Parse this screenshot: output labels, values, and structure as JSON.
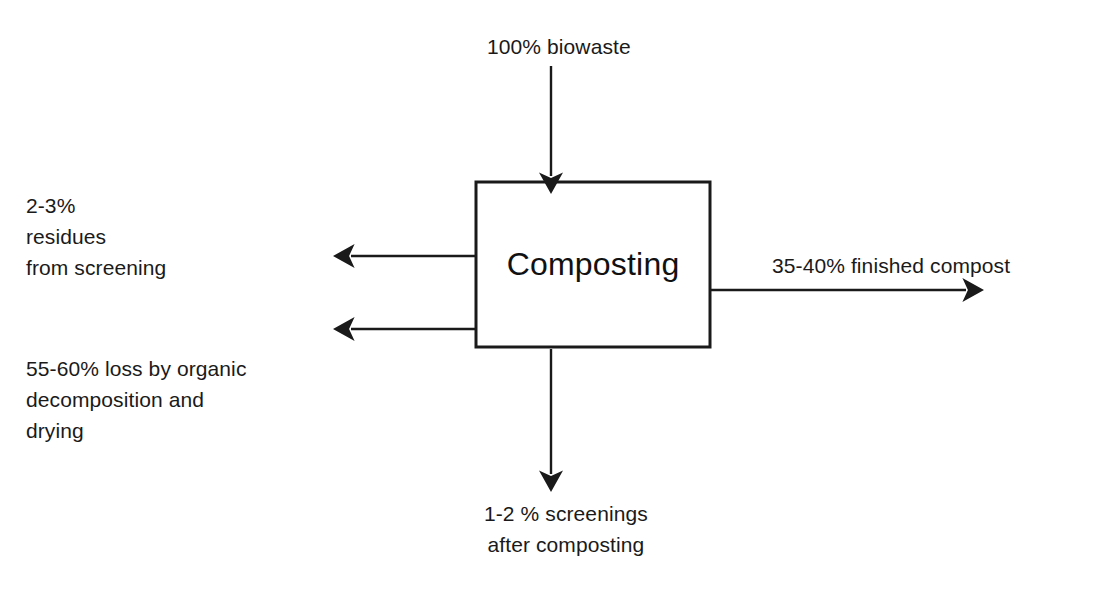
{
  "diagram": {
    "type": "process-flow",
    "stroke_color": "#1a1a1a",
    "text_color": "#1a1a1a",
    "background_color": "#ffffff",
    "process": {
      "name": "Composting",
      "label": "Composting"
    },
    "flows": [
      {
        "id": "input-top",
        "label": "100% biowaste",
        "direction": "down",
        "role": "input",
        "percent_min": 100,
        "percent_max": 100
      },
      {
        "id": "residues-screening",
        "label": "2-3%\nresidues\nfrom screening",
        "direction": "left",
        "role": "output",
        "percent_min": 2,
        "percent_max": 3
      },
      {
        "id": "organic-loss",
        "label": "55-60% loss by organic\ndecomposition and\ndrying",
        "direction": "left",
        "role": "output",
        "percent_min": 55,
        "percent_max": 60
      },
      {
        "id": "finished-compost",
        "label": "35-40% finished compost",
        "direction": "right",
        "role": "output",
        "percent_min": 35,
        "percent_max": 40
      },
      {
        "id": "screenings-after",
        "label": "1-2 % screenings\nafter composting",
        "direction": "down",
        "role": "output",
        "percent_min": 1,
        "percent_max": 2
      }
    ]
  }
}
